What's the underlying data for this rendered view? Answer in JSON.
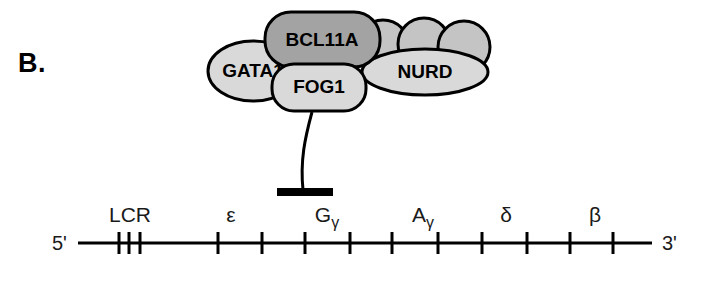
{
  "panel": {
    "label": "B."
  },
  "colors": {
    "outline": "#000000",
    "light_gray": "#d9d9d9",
    "mid_gray": "#c4c4c4",
    "dark_gray": "#a3a3a3",
    "line": "#000000",
    "text": "#1a1a1a"
  },
  "complex": {
    "proteins": [
      {
        "name": "GATA1",
        "shape": "ellipse",
        "fill": "light_gray",
        "cx": 253,
        "cy": 71,
        "rx": 45,
        "ry": 30
      },
      {
        "name": "BCL11A",
        "shape": "rounded-rect",
        "fill": "dark_gray",
        "x": 265,
        "y": 12,
        "width": 115,
        "height": 55,
        "radius": 26
      },
      {
        "name": "FOG1",
        "shape": "rounded-rect",
        "fill": "light_gray",
        "x": 272,
        "y": 64,
        "width": 94,
        "height": 47,
        "radius": 22
      },
      {
        "name": "NURD",
        "shape": "ellipse",
        "fill": "light_gray",
        "cx": 425,
        "cy": 72,
        "rx": 63,
        "ry": 23
      }
    ],
    "nurd_subunits": [
      {
        "name": "nurd-subunit-1",
        "fill": "mid_gray",
        "cx": 383,
        "cy": 46,
        "rx": 26,
        "ry": 26
      },
      {
        "name": "nurd-subunit-2",
        "fill": "mid_gray",
        "cx": 424,
        "cy": 44,
        "rx": 26,
        "ry": 26
      },
      {
        "name": "nurd-subunit-3",
        "fill": "mid_gray",
        "cx": 464,
        "cy": 47,
        "rx": 26,
        "ry": 26
      }
    ],
    "repression": {
      "stem_path": "M 312 112 C 305 138 300 160 303 190",
      "bar_x": 277,
      "bar_y": 188,
      "bar_width": 56,
      "bar_height": 8
    }
  },
  "locus": {
    "axis": {
      "y": 243,
      "x_start": 78,
      "x_end": 652,
      "stroke_width": 3
    },
    "five_prime": "5'",
    "three_prime": "3'",
    "tick_height": 22,
    "ticks": [
      {
        "name": "lcr-tick-1",
        "x": 119
      },
      {
        "name": "lcr-tick-2",
        "x": 129
      },
      {
        "name": "lcr-tick-3",
        "x": 140
      },
      {
        "name": "tick-epsilon-left",
        "x": 218
      },
      {
        "name": "tick-epsilon-right",
        "x": 262
      },
      {
        "name": "tick-ggamma-left",
        "x": 305
      },
      {
        "name": "tick-ggamma-right",
        "x": 350
      },
      {
        "name": "tick-agamma-left",
        "x": 392
      },
      {
        "name": "tick-agamma-right",
        "x": 438
      },
      {
        "name": "tick-delta-left",
        "x": 482
      },
      {
        "name": "tick-delta-right",
        "x": 527
      },
      {
        "name": "tick-beta-left",
        "x": 570
      },
      {
        "name": "tick-beta-right",
        "x": 613
      }
    ],
    "genes": [
      {
        "name": "LCR",
        "base": "LCR",
        "sub": "",
        "x": 130,
        "y": 222
      },
      {
        "name": "epsilon",
        "base": "ε",
        "sub": "",
        "x": 231,
        "y": 222
      },
      {
        "name": "Ggamma",
        "base": "G",
        "sub": "γ",
        "x": 327,
        "y": 222
      },
      {
        "name": "Agamma",
        "base": "A",
        "sub": "γ",
        "x": 423,
        "y": 222
      },
      {
        "name": "delta",
        "base": "δ",
        "sub": "",
        "x": 506,
        "y": 222
      },
      {
        "name": "beta",
        "base": "β",
        "sub": "",
        "x": 595,
        "y": 222
      }
    ]
  }
}
